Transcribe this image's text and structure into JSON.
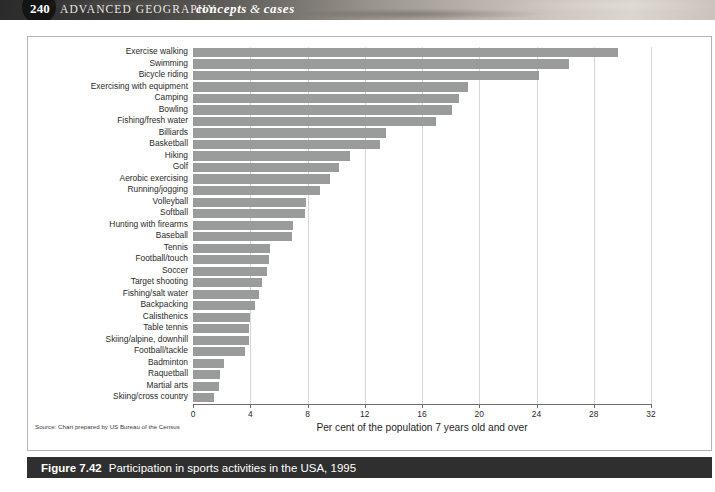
{
  "header": {
    "page_number": "240",
    "book_title": "ADVANCED GEOGRAPHY",
    "series_left": "concepts",
    "series_amp": "&",
    "series_right": "cases"
  },
  "caption": {
    "figure_number": "Figure 7.42",
    "figure_title": "Participation in sports activities in the USA, 1995"
  },
  "source_note": "Source: Chart prepared by US Bureau of the Census",
  "colors": {
    "bar": "#9a9b9b",
    "gridline": "#d6d6d6",
    "axis": "#6d6d6d",
    "caption_bar": "#2f2f2f",
    "frame_border": "#b4b4b4"
  },
  "chart_data": {
    "type": "bar",
    "orientation": "horizontal",
    "title": "Participation in sports activities in the USA, 1995",
    "xlabel": "Per cent of the population 7 years old and over",
    "ylabel": "",
    "xlim": [
      0,
      32
    ],
    "xticks": [
      0,
      4,
      8,
      12,
      16,
      20,
      24,
      28,
      32
    ],
    "xtick_labels": [
      "0",
      "4",
      "8",
      "12",
      "16",
      "20",
      "24",
      "28",
      "32"
    ],
    "grid": true,
    "grid_axis": "x",
    "legend": false,
    "categories": [
      "Exercise walking",
      "Swimming",
      "Bicycle riding",
      "Exercising with equipment",
      "Camping",
      "Bowling",
      "Fishing/fresh water",
      "Billiards",
      "Basketball",
      "Hiking",
      "Golf",
      "Aerobic exercising",
      "Running/jogging",
      "Volleyball",
      "Softball",
      "Hunting with firearms",
      "Baseball",
      "Tennis",
      "Football/touch",
      "Soccer",
      "Target shooting",
      "Fishing/salt water",
      "Backpacking",
      "Calisthenics",
      "Table tennis",
      "Skiing/alpine, downhill",
      "Football/tackle",
      "Badminton",
      "Raquetball",
      "Martial arts",
      "Skiing/cross country"
    ],
    "values": [
      29.7,
      26.3,
      24.2,
      19.2,
      18.6,
      18.1,
      17.0,
      13.5,
      13.1,
      11.0,
      10.2,
      9.6,
      8.9,
      7.9,
      7.8,
      7.0,
      6.9,
      5.4,
      5.3,
      5.2,
      4.8,
      4.6,
      4.3,
      4.0,
      3.9,
      3.9,
      3.6,
      2.2,
      1.9,
      1.8,
      1.5
    ],
    "value_unit": "per cent"
  }
}
